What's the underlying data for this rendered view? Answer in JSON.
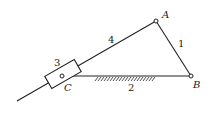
{
  "diagram": {
    "type": "mechanism",
    "points": {
      "A": {
        "label": "A",
        "x": 156,
        "y": 21
      },
      "B": {
        "label": "B",
        "x": 191,
        "y": 76
      },
      "C": {
        "label": "C",
        "x": 62,
        "y": 76
      }
    },
    "links": [
      {
        "id": "1",
        "label": "1",
        "from": "A",
        "to": "B"
      },
      {
        "id": "2",
        "label": "2",
        "from": "C",
        "to": "B",
        "ground": true
      },
      {
        "id": "3",
        "label": "3",
        "type": "slider",
        "at": "C"
      },
      {
        "id": "4",
        "label": "4",
        "from": "A",
        "to": "tail"
      }
    ],
    "colors": {
      "stroke": "#222222",
      "background": "#ffffff"
    }
  }
}
